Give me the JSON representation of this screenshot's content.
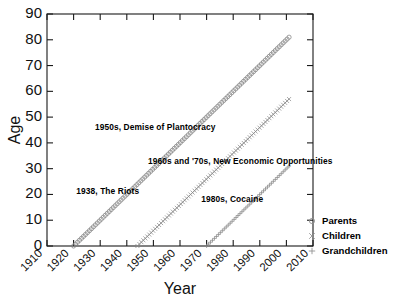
{
  "chart_data": {
    "type": "line",
    "title": "",
    "xlabel": "Year",
    "ylabel": "Age",
    "xlim": [
      1910,
      2010
    ],
    "ylim": [
      0,
      90
    ],
    "xticks": [
      1910,
      1920,
      1930,
      1940,
      1950,
      1960,
      1970,
      1980,
      1990,
      2000,
      2010
    ],
    "yticks": [
      0,
      10,
      20,
      30,
      40,
      50,
      60,
      70,
      80,
      90
    ],
    "grid": false,
    "legend_position": "right",
    "series": [
      {
        "name": "Parents",
        "marker": "circle",
        "x": [
          1920,
          1925,
          1930,
          1935,
          1940,
          1945,
          1950,
          1955,
          1960,
          1965,
          1970,
          1975,
          1980,
          1985,
          1990,
          1995,
          2000,
          2001
        ],
        "values": [
          0,
          5,
          10,
          15,
          20,
          25,
          30,
          35,
          40,
          45,
          50,
          55,
          60,
          65,
          70,
          75,
          80,
          81
        ]
      },
      {
        "name": "Children",
        "marker": "cross",
        "x": [
          1944,
          1950,
          1955,
          1960,
          1965,
          1970,
          1975,
          1980,
          1985,
          1990,
          1995,
          2000,
          2001
        ],
        "values": [
          0,
          6,
          11,
          16,
          21,
          26,
          31,
          36,
          41,
          46,
          51,
          56,
          57
        ]
      },
      {
        "name": "Grandchildren",
        "marker": "plus",
        "x": [
          1970,
          1975,
          1980,
          1985,
          1990,
          1995,
          2000,
          2001
        ],
        "values": [
          0,
          5,
          10,
          15,
          20,
          25,
          30,
          31
        ]
      }
    ],
    "annotations": [
      {
        "text": "1950s, Demise of Plantocracy",
        "x": 1928,
        "y": 45
      },
      {
        "text": "1960s and '70s, New Economic Opportunities",
        "x": 1948,
        "y": 32
      },
      {
        "text": "1938, The Riots",
        "x": 1921,
        "y": 20
      },
      {
        "text": "1980s, Cocaine",
        "x": 1968,
        "y": 17
      }
    ]
  },
  "legend": {
    "items": [
      {
        "label": "Parents",
        "marker": "circle"
      },
      {
        "label": "Children",
        "marker": "cross"
      },
      {
        "label": "Grandchildren",
        "marker": "plus"
      }
    ]
  },
  "axes": {
    "x_title": "Year",
    "y_title": "Age"
  }
}
